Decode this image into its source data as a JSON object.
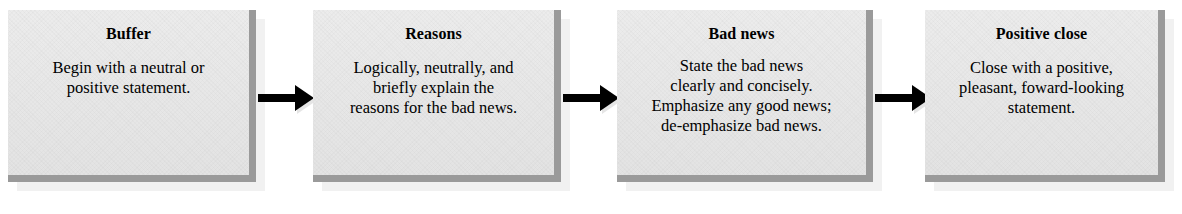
{
  "diagram": {
    "orientation": "left-to-right",
    "box_fill_color": "#e8e8e8",
    "box_bevel_color": "#9a9a9a",
    "arrow_color": "#000000",
    "text_color": "#000000",
    "steps": [
      {
        "title": "Buffer",
        "lines": [
          "Begin with a neutral or",
          "positive statement."
        ]
      },
      {
        "title": "Reasons",
        "lines": [
          "Logically, neutrally, and",
          "briefly explain the",
          "reasons for the bad news."
        ]
      },
      {
        "title": "Bad news",
        "lines": [
          "State the bad news",
          "clearly and concisely.",
          "Emphasize any good news;",
          "de-emphasize bad news."
        ]
      },
      {
        "title": "Positive close",
        "lines": [
          "Close with a positive,",
          "pleasant, foward-looking",
          "statement."
        ]
      }
    ],
    "connectors": [
      {
        "name": "arrow-buffer-to-reasons"
      },
      {
        "name": "arrow-reasons-to-bad-news"
      },
      {
        "name": "arrow-bad-news-to-positive-close"
      }
    ]
  }
}
